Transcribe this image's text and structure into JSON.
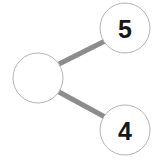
{
  "diagram": {
    "type": "node-link-tree",
    "background_color": "#ffffff",
    "edge_color": "#8c8c8c",
    "edge_width": 5,
    "node_fill": "#ffffff",
    "node_stroke": "#b4b4b4",
    "node_stroke_width": 1,
    "label_color": "#181818",
    "nodes": [
      {
        "id": "root",
        "label": "",
        "cx": 38,
        "cy": 78,
        "r": 25,
        "role": "root-node"
      },
      {
        "id": "child-top",
        "label": "5",
        "cx": 125,
        "cy": 28,
        "r": 25,
        "role": "leaf-node"
      },
      {
        "id": "child-bottom",
        "label": "4",
        "cx": 125,
        "cy": 130,
        "r": 25,
        "role": "leaf-node"
      }
    ],
    "edges": [
      {
        "id": "edge-root-top",
        "from": "root",
        "to": "child-top",
        "x1": 59,
        "y1": 64,
        "x2": 105,
        "y2": 41
      },
      {
        "id": "edge-root-bottom",
        "from": "root",
        "to": "child-bottom",
        "x1": 59,
        "y1": 92,
        "x2": 105,
        "y2": 117
      }
    ]
  }
}
